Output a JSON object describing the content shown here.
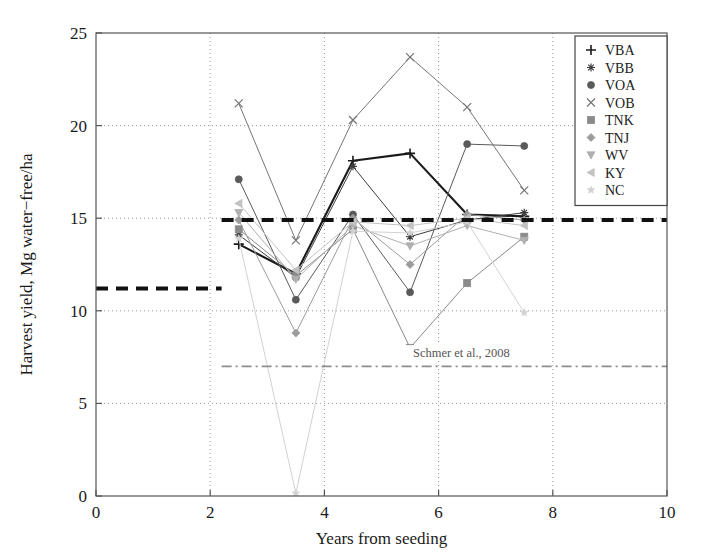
{
  "chart_data": {
    "type": "line",
    "title": "",
    "xlabel": "Years from seeding",
    "ylabel": "Harvest yield, Mg water−free/ha",
    "xlim": [
      0,
      10
    ],
    "ylim": [
      0,
      25
    ],
    "xticks": [
      0,
      2,
      4,
      6,
      8,
      10
    ],
    "yticks": [
      0,
      5,
      10,
      15,
      20,
      25
    ],
    "xtick_labels": [
      "0",
      "2",
      "4",
      "6",
      "8",
      "10"
    ],
    "ytick_labels": [
      "0",
      "5",
      "10",
      "15",
      "20",
      "25"
    ],
    "grid": "dotted",
    "legend_position": "top-right",
    "x": [
      2.5,
      3.5,
      4.5,
      5.5,
      6.5,
      7.5
    ],
    "series": [
      {
        "name": "VBA",
        "marker": "plus",
        "color": "#1a1a1a",
        "values": [
          13.6,
          12.0,
          18.1,
          18.5,
          15.2,
          15.1
        ]
      },
      {
        "name": "VBB",
        "marker": "asterisk",
        "color": "#3d3d3d",
        "values": [
          14.1,
          11.8,
          17.8,
          14.0,
          14.9,
          15.3
        ]
      },
      {
        "name": "VOA",
        "marker": "circle",
        "color": "#5a5a5a",
        "values": [
          17.1,
          10.6,
          15.2,
          11.0,
          19.0,
          18.9
        ]
      },
      {
        "name": "VOB",
        "marker": "cross",
        "color": "#757575",
        "values": [
          21.2,
          13.8,
          20.3,
          23.7,
          21.0,
          16.5
        ]
      },
      {
        "name": "TNK",
        "marker": "square",
        "color": "#8a8a8a",
        "values": [
          14.4,
          11.9,
          14.4,
          8.0,
          11.5,
          14.0
        ]
      },
      {
        "name": "TNJ",
        "marker": "diamond",
        "color": "#9c9c9c",
        "values": [
          14.9,
          8.8,
          15.0,
          12.5,
          15.2,
          14.9
        ]
      },
      {
        "name": "WV",
        "marker": "triangle-down",
        "color": "#b0b0b0",
        "values": [
          15.3,
          11.7,
          14.6,
          13.5,
          14.6,
          13.8
        ]
      },
      {
        "name": "KY",
        "marker": "triangle-left",
        "color": "#c2c2c2",
        "values": [
          15.8,
          12.2,
          14.8,
          14.6,
          15.0,
          14.6
        ]
      },
      {
        "name": "NC",
        "marker": "star",
        "color": "#d2d2d2",
        "values": [
          13.9,
          0.15,
          14.3,
          14.2,
          14.8,
          9.9
        ]
      }
    ],
    "reference_lines": [
      {
        "name": "mean-step-low",
        "style": "thick-dashed",
        "y": 11.2,
        "x_start": 0.0,
        "x_end": 2.2
      },
      {
        "name": "mean-step-high",
        "style": "thick-dashed",
        "y": 14.9,
        "x_start": 2.2,
        "x_end": 10.0
      },
      {
        "name": "schmer",
        "style": "dash-dot",
        "y": 7.0,
        "x_start": 2.2,
        "x_end": 10.0
      }
    ],
    "annotations": [
      {
        "name": "schmer-label",
        "text": "Schmer et al., 2008",
        "x": 6.4,
        "y": 7.5
      }
    ],
    "legend_entries": [
      {
        "label": "VBA",
        "marker": "plus"
      },
      {
        "label": "VBB",
        "marker": "asterisk"
      },
      {
        "label": "VOA",
        "marker": "circle"
      },
      {
        "label": "VOB",
        "marker": "cross"
      },
      {
        "label": "TNK",
        "marker": "square"
      },
      {
        "label": "TNJ",
        "marker": "diamond"
      },
      {
        "label": "WV",
        "marker": "triangle-down"
      },
      {
        "label": "KY",
        "marker": "triangle-left"
      },
      {
        "label": "NC",
        "marker": "star"
      }
    ]
  }
}
